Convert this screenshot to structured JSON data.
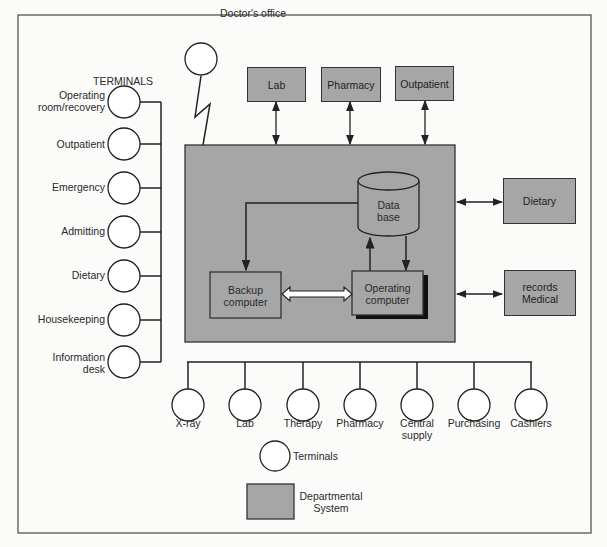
{
  "diagram": {
    "title_terminals": "TERMINALS",
    "doctor_office": "Doctor's office",
    "top_departments": [
      "Lab",
      "Pharmacy",
      "Outpatient"
    ],
    "right_departments": [
      "Dietary",
      "records\nMedical"
    ],
    "right_departments_lines": [
      [
        "Dietary"
      ],
      [
        "records",
        "Medical"
      ]
    ],
    "left_terminals": [
      [
        "Operating",
        "room/recovery"
      ],
      [
        "Outpatient"
      ],
      [
        "Emergency"
      ],
      [
        "Admitting"
      ],
      [
        "Dietary"
      ],
      [
        "Housekeeping"
      ],
      [
        "Information",
        "desk"
      ]
    ],
    "bottom_terminals": [
      [
        "X-ray"
      ],
      [
        "Lab"
      ],
      [
        "Therapy"
      ],
      [
        "Pharmacy"
      ],
      [
        "Central",
        "supply"
      ],
      [
        "Purchasing"
      ],
      [
        "Cashiers"
      ]
    ],
    "central": {
      "database": [
        "Data",
        "base"
      ],
      "backup": [
        "Backup",
        "computer"
      ],
      "operating": [
        "Operating",
        "computer"
      ]
    },
    "legend": {
      "terminals": "Terminals",
      "departmental": [
        "Departmental",
        "System"
      ]
    },
    "colors": {
      "box_fill": "#a6a6a6",
      "line": "#222222",
      "background": "#fbfbfa"
    }
  }
}
